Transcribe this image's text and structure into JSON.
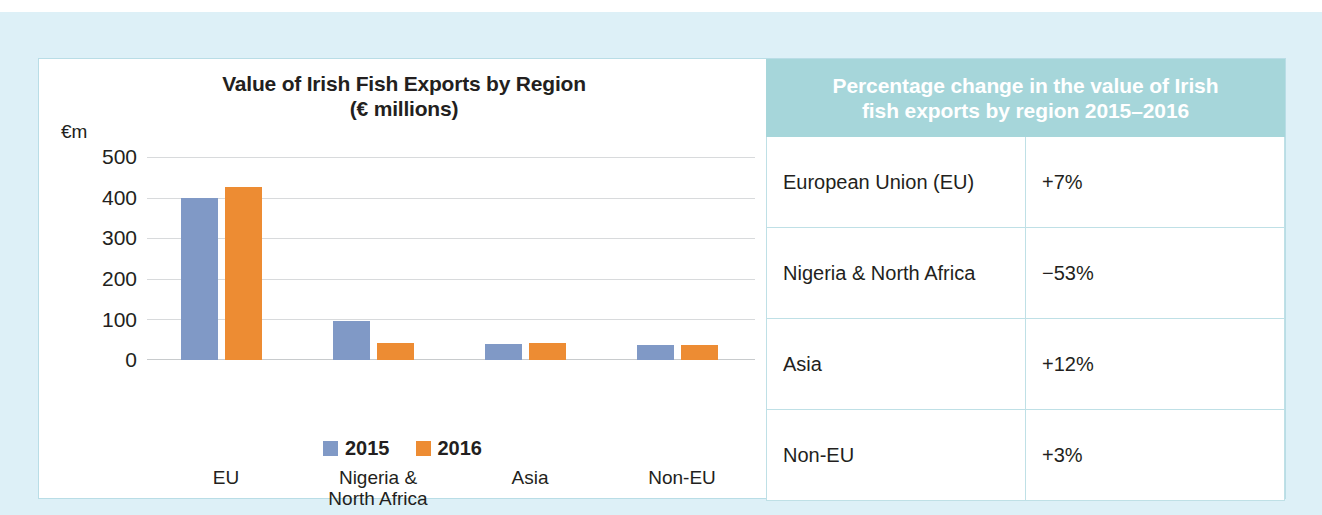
{
  "chart_data": {
    "type": "bar",
    "title": "Value of Irish Fish Exports by Region (€ millions)",
    "title_line1": "Value of Irish Fish Exports by Region",
    "title_line2": "(€ millions)",
    "ylabel": "€m",
    "xlabel": "",
    "ylim": [
      0,
      500
    ],
    "yticks": [
      "500",
      "400",
      "300",
      "200",
      "100",
      "0"
    ],
    "ytick_values": [
      500,
      400,
      300,
      200,
      100,
      0
    ],
    "grid": true,
    "legend_position": "bottom",
    "categories": [
      "EU",
      "Nigeria & North Africa",
      "Asia",
      "Non-EU"
    ],
    "category_lines": [
      [
        "EU"
      ],
      [
        "Nigeria &",
        "North Africa"
      ],
      [
        "Asia"
      ],
      [
        "Non-EU"
      ]
    ],
    "series": [
      {
        "name": "2015",
        "color": "#8099c6",
        "values": [
          400,
          95,
          40,
          36
        ]
      },
      {
        "name": "2016",
        "color": "#ed8c33",
        "values": [
          427,
          43,
          42,
          38
        ]
      }
    ]
  },
  "table": {
    "header": "Percentage change in the value of Irish fish exports by region 2015–2016",
    "header_line1": "Percentage change in the value of Irish",
    "header_line2": "fish exports by region 2015–2016",
    "header_color": "#a6d6da",
    "rows": [
      {
        "region": "European Union (EU)",
        "change": "+7%"
      },
      {
        "region": "Nigeria & North Africa",
        "change": "−53%"
      },
      {
        "region": "Asia",
        "change": "+12%"
      },
      {
        "region": "Non-EU",
        "change": "+3%"
      }
    ]
  },
  "theme": {
    "frame_color": "#ddf0f7",
    "panel_border": "#b9dde6",
    "series_2015": "#8099c6",
    "series_2016": "#ed8c33",
    "accent_teal": "#a6d6da",
    "text_color": "#231f20"
  }
}
